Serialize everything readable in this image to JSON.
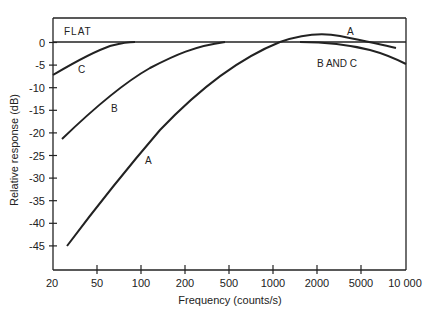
{
  "chart_data": {
    "type": "line",
    "title": "",
    "xlabel": "Frequency (counts/s)",
    "ylabel": "Relative response (dB)",
    "x_scale": "log",
    "x_ticks": [
      "20",
      "50",
      "100",
      "200",
      "500",
      "1000",
      "2000",
      "5000",
      "10 000"
    ],
    "y_ticks": [
      0,
      -5,
      -10,
      -15,
      -20,
      -25,
      -30,
      -35,
      -40,
      -45
    ],
    "y_tick_labels": [
      "0",
      "-5",
      "-10",
      "-15",
      "-20",
      "-25",
      "-30",
      "-35",
      "-40",
      "-45"
    ],
    "ylim": [
      -50,
      5
    ],
    "grid": false,
    "series": [
      {
        "name": "FLAT",
        "x": [
          20,
          10000
        ],
        "values": [
          0,
          0
        ]
      },
      {
        "name": "A",
        "x": [
          25,
          50,
          100,
          200,
          500,
          1000,
          2000,
          5000,
          8000
        ],
        "values": [
          -45,
          -31,
          -19.5,
          -10.5,
          -3,
          0,
          1.8,
          0.7,
          -1.2
        ]
      },
      {
        "name": "B",
        "x": [
          22,
          50,
          100,
          200,
          400,
          1000,
          2000,
          5000,
          10000
        ],
        "values": [
          -21.5,
          -13,
          -7.5,
          -3,
          0,
          0,
          -0.2,
          -1.5,
          -5
        ]
      },
      {
        "name": "C",
        "x": [
          20,
          30,
          50,
          80,
          100,
          1000,
          2000,
          5000,
          10000
        ],
        "values": [
          -7,
          -4.5,
          -2,
          0,
          0,
          0,
          -0.2,
          -1.5,
          -5
        ]
      }
    ],
    "annotations": [
      "FLAT",
      "A",
      "B",
      "C",
      "A",
      "B AND C"
    ]
  },
  "labels": {
    "flat": "FLAT",
    "a_low": "A",
    "b_low": "B",
    "c_low": "C",
    "a_high": "A",
    "bc_high": "B AND C"
  }
}
